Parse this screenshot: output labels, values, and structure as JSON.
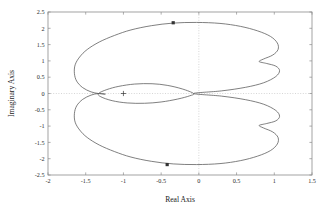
{
  "chart_data": {
    "type": "line",
    "title": "",
    "xlabel": "Real Axis",
    "ylabel": "Imaginary Axis",
    "xlim": [
      -2,
      1.5
    ],
    "ylim": [
      -2.5,
      2.5
    ],
    "xticks": [
      "-2",
      "-1.5",
      "-1",
      "-0.5",
      "0",
      "0.5",
      "1",
      "1.5"
    ],
    "xtick_values": [
      -2,
      -1.5,
      -1,
      -0.5,
      0,
      0.5,
      1,
      1.5
    ],
    "yticks": [
      "2.5",
      "2",
      "1.5",
      "1",
      "0.5",
      "0",
      "-0.5",
      "-1",
      "-1.5",
      "-2",
      "-2.5"
    ],
    "ytick_values": [
      2.5,
      2,
      1.5,
      1,
      0.5,
      0,
      -0.5,
      -1,
      -1.5,
      -2,
      -2.5
    ],
    "grid": "dotted-zero-lines-only",
    "legend": "none",
    "line_color": "#555555",
    "marker_color": "#333333",
    "axis_color": "#8c8c8c",
    "gridline_color": "#bbbbbb",
    "series": [
      {
        "name": "nyquist-outer-contour",
        "comment": "Cardioid-like closed contour, symmetric about the real axis, with a cusp indentation on the right near Re=0.8",
        "x": [
          -0.07,
          0.3,
          0.62,
          0.86,
          1.02,
          1.07,
          1.02,
          0.9,
          0.8,
          0.86,
          0.98,
          1.05,
          1.04,
          0.95,
          0.78,
          0.55,
          0.28,
          -0.03,
          -0.34,
          -0.63,
          -0.9,
          -1.12,
          -1.32,
          -1.48,
          -1.58,
          -1.64,
          -1.65,
          -1.62,
          -1.54,
          -1.43,
          -1.33,
          -1.24
        ],
        "y": [
          0.0,
          0.08,
          0.19,
          0.33,
          0.52,
          0.7,
          0.84,
          0.92,
          0.98,
          1.06,
          1.18,
          1.35,
          1.55,
          1.75,
          1.92,
          2.06,
          2.15,
          2.18,
          2.16,
          2.08,
          1.95,
          1.78,
          1.58,
          1.35,
          1.12,
          0.88,
          0.62,
          0.38,
          0.18,
          0.05,
          0.0,
          -0.02
        ]
      },
      {
        "name": "nyquist-inner-loop",
        "comment": "Small inner loop on the left, encircling toward the -1 point",
        "x": [
          -0.07,
          -0.22,
          -0.42,
          -0.62,
          -0.85,
          -1.06,
          -1.22,
          -1.33,
          -1.3,
          -1.15,
          -0.95,
          -0.72,
          -0.5,
          -0.28,
          -0.12,
          -0.07
        ],
        "y": [
          0.0,
          0.14,
          0.25,
          0.3,
          0.29,
          0.22,
          0.12,
          0.0,
          -0.1,
          -0.22,
          -0.29,
          -0.3,
          -0.26,
          -0.17,
          -0.07,
          0.0
        ]
      }
    ],
    "markers": [
      {
        "name": "upper-frequency-marker",
        "x": -0.34,
        "y": 2.17,
        "shape": "square-dot"
      },
      {
        "name": "lower-frequency-marker",
        "x": -0.42,
        "y": -2.18,
        "shape": "square-dot"
      },
      {
        "name": "critical-point-marker",
        "x": -1.0,
        "y": 0.0,
        "shape": "plus"
      }
    ]
  }
}
